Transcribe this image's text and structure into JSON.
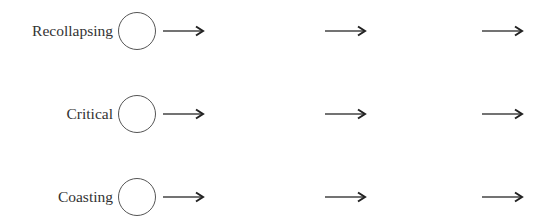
{
  "diagram": {
    "type": "state-sequence",
    "colors": {
      "text": "#333333",
      "circle_stroke": "#555555",
      "arrow": "#333333",
      "background": "#ffffff"
    },
    "rows": [
      {
        "label": "Recollapsing",
        "node": "circle-icon",
        "arrows": [
          "arrow-right-icon",
          "arrow-right-icon",
          "arrow-right-icon"
        ]
      },
      {
        "label": "Critical",
        "node": "circle-icon",
        "arrows": [
          "arrow-right-icon",
          "arrow-right-icon",
          "arrow-right-icon"
        ]
      },
      {
        "label": "Coasting",
        "node": "circle-icon",
        "arrows": [
          "arrow-right-icon",
          "arrow-right-icon",
          "arrow-right-icon"
        ]
      }
    ]
  }
}
